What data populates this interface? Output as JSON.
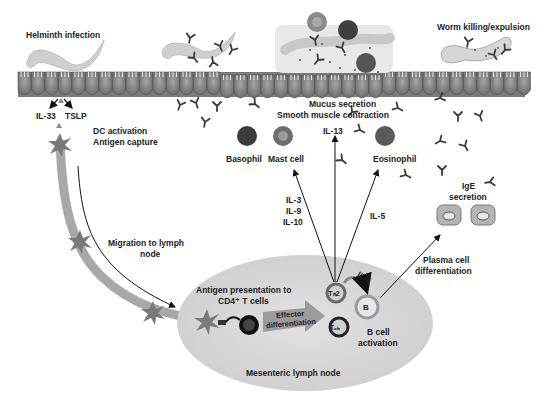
{
  "diagram": {
    "colors": {
      "epithelium": "#8c8c8c",
      "worm": "#cfcfcf",
      "lymph_node": "#dcdcdc",
      "lymph_vessel": "#a8a8a8",
      "dendritic_cell": "#7a7a7a",
      "antibody": "#444444",
      "arrow": "#111111"
    },
    "labels": {
      "helminth_infection": "Helminth infection",
      "worm_killing": "Worm killing/expulsion",
      "il33": "IL-33",
      "tslp": "TSLP",
      "dc_activation": "DC activation",
      "antigen_capture": "Antigen capture",
      "migration_line1": "Migration to lymph",
      "migration_line2": "node",
      "mucus_secretion": "Mucus secretion",
      "smooth_muscle": "Smooth muscle contraction",
      "il13": "IL-13",
      "basophil": "Basophil",
      "mast_cell": "Mast cell",
      "eosinophil": "Eosinophil",
      "il3": "IL-3",
      "il9": "IL-9",
      "il10": "IL-10",
      "il5": "IL-5",
      "ige_line1": "IgE",
      "ige_line2": "secretion",
      "plasma_line1": "Plasma cell",
      "plasma_line2": "differentiation",
      "antigen_pres_line1": "Antigen presentation to",
      "antigen_pres_line2": "CD4⁺ T cells",
      "effector_line1": "Effector",
      "effector_line2": "differentiation",
      "il4": "IL-4",
      "th2": "Tₕ2",
      "tfh": "Tₒₕ",
      "b": "B",
      "b_cell_line1": "B cell",
      "b_cell_line2": "activation",
      "lymph_node": "Mesenteric lymph node"
    }
  }
}
